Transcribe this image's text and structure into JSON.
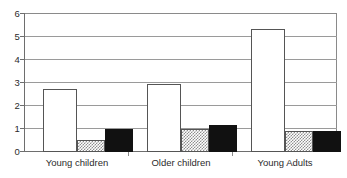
{
  "chart_data": {
    "type": "bar",
    "title": "",
    "subtitle": "",
    "xlabel": "",
    "ylabel": "",
    "ylim": [
      0,
      6
    ],
    "yticks": [
      0,
      1,
      2,
      3,
      4,
      5,
      6
    ],
    "ytick_labels": [
      "0",
      "1",
      "2",
      "3",
      "4",
      "5",
      "6"
    ],
    "grid": true,
    "legend": false,
    "legend_position": "none",
    "categories": [
      "Young children",
      "Older children",
      "Young Adults"
    ],
    "series": [
      {
        "name": "series-1",
        "style": "open-white",
        "values": [
          2.7,
          2.95,
          5.3
        ]
      },
      {
        "name": "series-2",
        "style": "hatched-gray",
        "values": [
          0.5,
          1.0,
          0.9
        ]
      },
      {
        "name": "series-3",
        "style": "solid-black",
        "values": [
          1.0,
          1.15,
          0.92
        ]
      }
    ],
    "colors": {
      "series_1_fill": "#ffffff",
      "series_2_fill": "#8f8f8f",
      "series_3_fill": "#111111",
      "bar_outline": "#555555",
      "gridline": "#9a9a9a",
      "axis": "#6e6e6e",
      "text": "#2b2b2b",
      "background": "#ffffff"
    }
  }
}
